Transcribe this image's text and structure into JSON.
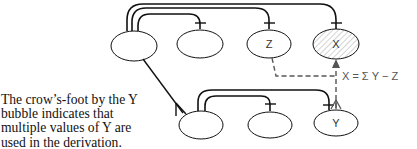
{
  "diagram": {
    "type": "data-derivation",
    "colors": {
      "line": "#111111",
      "dashed": "#555555",
      "hatch": "#aaaaaa"
    },
    "top_row": [
      {
        "id": "t1",
        "label": ""
      },
      {
        "id": "t2",
        "label": ""
      },
      {
        "id": "z",
        "label": "Z"
      },
      {
        "id": "x",
        "label": "X",
        "hatched": true
      }
    ],
    "bottom_row": [
      {
        "id": "b1",
        "label": ""
      },
      {
        "id": "b2",
        "label": ""
      },
      {
        "id": "y",
        "label": "Y"
      }
    ],
    "formula": "X = Σ Y − Z",
    "caption_lines": [
      "The crow’s-foot by the Y",
      "bubble indicates that",
      "multiple values of Y are",
      "used in the derivation."
    ]
  }
}
